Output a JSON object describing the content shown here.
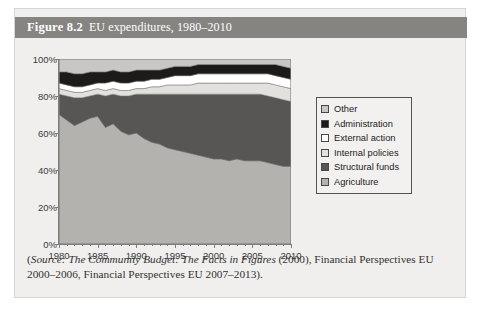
{
  "figure": {
    "number": "Figure 8.2",
    "title": "EU expenditures, 1980–2010",
    "header_bg": "#868481",
    "card_bg": "#f0efee"
  },
  "source_note": {
    "prefix": "(",
    "source_label": "Source:",
    "italic_title": "The Community Budget: The Facts in Figures",
    "rest": " (2000), Financial Perspectives EU 2000–2006, Financial Perspectives EU 2007–2013).",
    "full_text": "(Source: The Community Budget: The Facts in Figures (2000), Financial Perspectives EU 2000–2006, Financial Perspectives EU 2007–2013)."
  },
  "legend": {
    "position": "right",
    "items": [
      {
        "label": "Other",
        "color": "#c9c7c4"
      },
      {
        "label": "Administration",
        "color": "#1c1b1a"
      },
      {
        "label": "External action",
        "color": "#ffffff"
      },
      {
        "label": "Internal policies",
        "color": "#e3e1de"
      },
      {
        "label": "Structural funds",
        "color": "#585654"
      },
      {
        "label": "Agriculture",
        "color": "#b4b2af"
      }
    ]
  },
  "chart_data": {
    "type": "area",
    "stacked": true,
    "stack_total": 100,
    "title": "EU expenditures, 1980–2010",
    "xlabel": "",
    "ylabel": "",
    "xlim": [
      1980,
      2010
    ],
    "ylim": [
      0,
      100
    ],
    "grid": false,
    "y_tick_labels": [
      "0%",
      "20%",
      "40%",
      "60%",
      "80%",
      "100%"
    ],
    "y_ticks": [
      0,
      20,
      40,
      60,
      80,
      100
    ],
    "x_tick_labels": [
      "1980",
      "1985",
      "1990",
      "1995",
      "2000",
      "2005",
      "2010"
    ],
    "x_ticks": [
      1980,
      1985,
      1990,
      1995,
      2000,
      2005,
      2010
    ],
    "x": [
      1980,
      1981,
      1982,
      1983,
      1984,
      1985,
      1986,
      1987,
      1988,
      1989,
      1990,
      1991,
      1992,
      1993,
      1994,
      1995,
      1996,
      1997,
      1998,
      1999,
      2000,
      2001,
      2002,
      2003,
      2004,
      2005,
      2006,
      2007,
      2008,
      2009,
      2010
    ],
    "series": [
      {
        "name": "Agriculture",
        "color": "#b4b2af",
        "values": [
          70,
          67,
          64,
          66,
          68,
          69,
          63,
          65,
          61,
          59,
          60,
          57,
          55,
          54,
          52,
          51,
          50,
          49,
          48,
          47,
          46,
          46,
          45,
          46,
          45,
          45,
          45,
          44,
          43,
          42,
          42
        ]
      },
      {
        "name": "Structural funds",
        "color": "#585654",
        "values": [
          11,
          13,
          15,
          13,
          12,
          12,
          17,
          16,
          19,
          21,
          21,
          24,
          26,
          27,
          29,
          30,
          31,
          32,
          33,
          34,
          35,
          35,
          36,
          35,
          36,
          36,
          36,
          36,
          36,
          36,
          35
        ]
      },
      {
        "name": "Internal policies",
        "color": "#e3e1de",
        "values": [
          3,
          3,
          3,
          3,
          3,
          3,
          3,
          3,
          3,
          3,
          3,
          3,
          4,
          4,
          5,
          5,
          5,
          5,
          6,
          6,
          6,
          6,
          6,
          6,
          6,
          6,
          6,
          7,
          7,
          7,
          7
        ]
      },
      {
        "name": "External action",
        "color": "#ffffff",
        "values": [
          3,
          3,
          3,
          3,
          3,
          3,
          4,
          4,
          4,
          4,
          4,
          4,
          4,
          4,
          4,
          5,
          5,
          5,
          5,
          5,
          5,
          5,
          5,
          5,
          5,
          5,
          5,
          5,
          5,
          5,
          5
        ]
      },
      {
        "name": "Administration",
        "color": "#1c1b1a",
        "values": [
          6,
          7,
          7,
          7,
          7,
          6,
          6,
          6,
          6,
          6,
          6,
          6,
          5,
          5,
          5,
          5,
          5,
          5,
          5,
          5,
          5,
          5,
          5,
          5,
          5,
          5,
          5,
          5,
          6,
          6,
          6
        ]
      },
      {
        "name": "Other",
        "color": "#c9c7c4",
        "values": [
          7,
          7,
          8,
          8,
          7,
          7,
          7,
          6,
          7,
          7,
          6,
          6,
          6,
          6,
          5,
          4,
          4,
          4,
          3,
          3,
          3,
          3,
          3,
          3,
          3,
          3,
          3,
          3,
          3,
          4,
          5
        ]
      }
    ]
  }
}
